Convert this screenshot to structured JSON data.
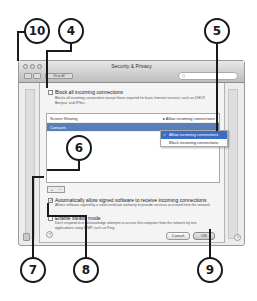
{
  "window": {
    "title": "Security & Privacy",
    "show_all_label": "Show All",
    "search_placeholder": "Q"
  },
  "firewall_options": {
    "block_all": {
      "label": "Block all incoming connections",
      "checked": false,
      "description": "Blocks all incoming connections except those required for basic Internet services, such as DHCP, Bonjour, and IPSec."
    },
    "services": [
      {
        "name": "Screen Sharing",
        "status": "Allow incoming connections",
        "selected": false
      },
      {
        "name": "Contacts",
        "status": "Allow incoming connections",
        "selected": true
      }
    ],
    "popup_menu": [
      {
        "label": "Allow incoming connections",
        "checked": true,
        "highlighted": true
      },
      {
        "label": "Block incoming connections",
        "checked": false,
        "highlighted": false
      }
    ],
    "add_label": "+",
    "remove_label": "−",
    "auto_allow_signed": {
      "label": "Automatically allow signed software to receive incoming connections",
      "checked": true,
      "description": "Allows software signed by a valid certificate authority to provide services accessed from the network."
    },
    "stealth_mode": {
      "label": "Enable stealth mode",
      "checked": false,
      "description": "Don't respond to or acknowledge attempts to access this computer from the network by test applications using ICMP, such as Ping."
    },
    "help_label": "?",
    "cancel_label": "Cancel",
    "ok_label": "OK"
  },
  "callouts": [
    "10",
    "4",
    "5",
    "6",
    "7",
    "8",
    "9"
  ]
}
